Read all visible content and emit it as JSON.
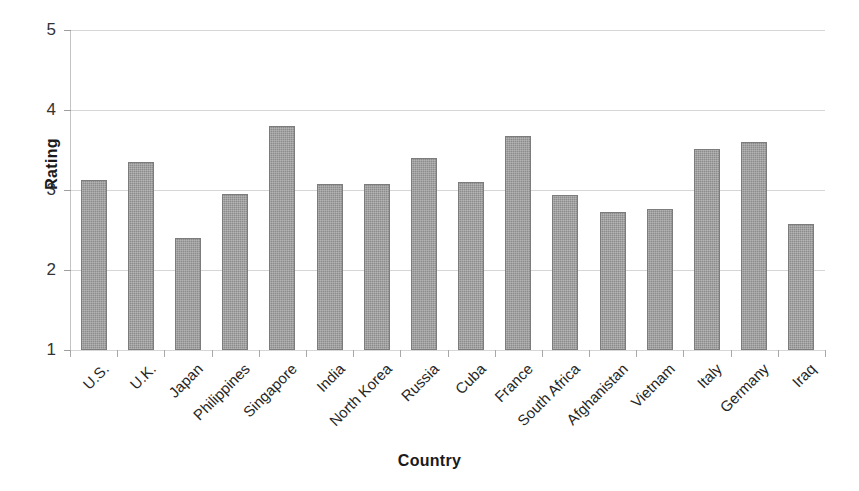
{
  "chart_data": {
    "type": "bar",
    "title": "",
    "xlabel": "Country",
    "ylabel": "Rating",
    "ylim": [
      1,
      5
    ],
    "yticks": [
      1,
      2,
      3,
      4,
      5
    ],
    "ytick_labels": [
      "1",
      "2",
      "3",
      "4",
      "5"
    ],
    "grid": true,
    "legend": false,
    "bar_color": "#8c8c8c",
    "categories": [
      "U.S.",
      "U.K.",
      "Japan",
      "Philippines",
      "Singapore",
      "India",
      "North Korea",
      "Russia",
      "Cuba",
      "France",
      "South Africa",
      "Afghanistan",
      "Vietnam",
      "Italy",
      "Germany",
      "Iraq"
    ],
    "values": [
      3.13,
      3.35,
      2.4,
      2.95,
      3.8,
      3.07,
      3.08,
      3.4,
      3.1,
      3.68,
      2.94,
      2.73,
      2.76,
      3.51,
      3.6,
      2.58
    ]
  },
  "axes": {
    "y_title": "Rating",
    "x_title": "Country"
  }
}
